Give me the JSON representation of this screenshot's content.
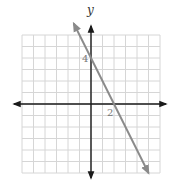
{
  "chart_data": {
    "type": "line",
    "title": "",
    "xlabel": "",
    "ylabel": "y",
    "xlim": [
      -6,
      6
    ],
    "ylim": [
      -6,
      6
    ],
    "grid": true,
    "grid_step": 1,
    "annotations": [
      {
        "text": "4",
        "at": [
          0,
          4
        ],
        "note": "y-intercept"
      },
      {
        "text": "2",
        "at": [
          2,
          0
        ],
        "note": "x-intercept"
      }
    ],
    "series": [
      {
        "name": "line",
        "equation": "y = -2x + 4",
        "slope": -2,
        "intercept": 4,
        "x": [
          -1.5,
          5
        ],
        "y": [
          7,
          -6
        ],
        "arrows": "both",
        "color": "#8a8a8a"
      }
    ],
    "axes_color": "#1a1a1a",
    "grid_color": "#d6d6d6"
  },
  "labels": {
    "y_axis": "y",
    "y_intercept": "4",
    "x_intercept": "2"
  }
}
